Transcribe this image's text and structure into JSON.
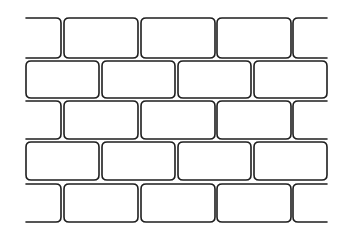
{
  "illustration": {
    "subject": "brick-wall",
    "background": "#ffffff",
    "stroke_color": "#1e1e1e",
    "stroke_width": 1.6,
    "corner_radius": 5,
    "rows": [
      {
        "y": 18,
        "h": 40,
        "bricks": [
          {
            "x": 26,
            "w": 35,
            "open": "left"
          },
          {
            "x": 64,
            "w": 74
          },
          {
            "x": 141,
            "w": 74
          },
          {
            "x": 217,
            "w": 74
          },
          {
            "x": 293,
            "w": 34,
            "open": "right"
          }
        ]
      },
      {
        "y": 61,
        "h": 37,
        "bricks": [
          {
            "x": 26,
            "w": 73
          },
          {
            "x": 102,
            "w": 73
          },
          {
            "x": 178,
            "w": 73
          },
          {
            "x": 254,
            "w": 73
          }
        ]
      },
      {
        "y": 101,
        "h": 38,
        "bricks": [
          {
            "x": 26,
            "w": 35,
            "open": "left"
          },
          {
            "x": 64,
            "w": 74
          },
          {
            "x": 141,
            "w": 74
          },
          {
            "x": 217,
            "w": 74
          },
          {
            "x": 293,
            "w": 34,
            "open": "right"
          }
        ]
      },
      {
        "y": 142,
        "h": 38,
        "bricks": [
          {
            "x": 26,
            "w": 73
          },
          {
            "x": 102,
            "w": 73
          },
          {
            "x": 178,
            "w": 73
          },
          {
            "x": 254,
            "w": 73
          }
        ]
      },
      {
        "y": 184,
        "h": 38,
        "bricks": [
          {
            "x": 26,
            "w": 35,
            "open": "left"
          },
          {
            "x": 64,
            "w": 74
          },
          {
            "x": 141,
            "w": 74
          },
          {
            "x": 217,
            "w": 74
          },
          {
            "x": 293,
            "w": 34,
            "open": "right"
          }
        ]
      }
    ]
  }
}
